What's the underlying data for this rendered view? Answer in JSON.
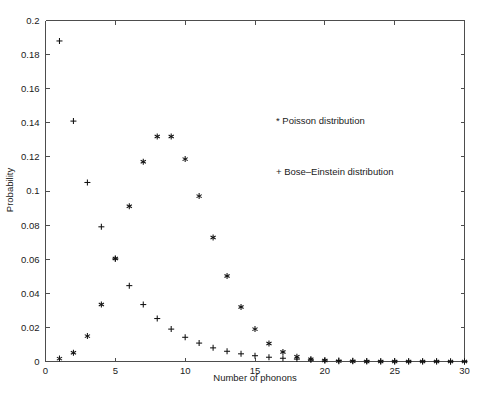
{
  "chart_data": {
    "type": "scatter",
    "title": "",
    "xlabel": "Number of phonons",
    "ylabel": "Probability",
    "xlim": [
      0,
      30
    ],
    "ylim": [
      0,
      0.2
    ],
    "xticks": [
      0,
      5,
      10,
      15,
      20,
      25,
      30
    ],
    "xticklabels": [
      "0",
      "5",
      "10",
      "15",
      "20",
      "25",
      "30"
    ],
    "yticks": [
      0,
      0.02,
      0.04,
      0.06,
      0.08,
      0.1,
      0.12,
      0.14,
      0.16,
      0.18,
      0.2
    ],
    "yticklabels": [
      "0",
      "0.02",
      "0.04",
      "0.06",
      "0.08",
      "0.1",
      "0.12",
      "0.14",
      "0.16",
      "0.18",
      "0.2"
    ],
    "grid": false,
    "legend_position": "upper-right-inside",
    "x": [
      1,
      2,
      3,
      4,
      5,
      6,
      7,
      8,
      9,
      10,
      11,
      12,
      13,
      14,
      15,
      16,
      17,
      18,
      19,
      20,
      21,
      22,
      23,
      24,
      25,
      26,
      27,
      28,
      29,
      30
    ],
    "series": [
      {
        "name": "Poisson distribution",
        "marker": "*",
        "legend_label": "* Poisson distribution",
        "color": "#111111",
        "values": [
          0.0017,
          0.0051,
          0.0149,
          0.0334,
          0.0604,
          0.0911,
          0.1172,
          0.132,
          0.132,
          0.1187,
          0.097,
          0.0727,
          0.0501,
          0.032,
          0.019,
          0.0106,
          0.0056,
          0.0028,
          0.0013,
          0.0006,
          0.0002,
          0.0001,
          0.0,
          0.0,
          0.0,
          0.0,
          0.0,
          0.0,
          0.0,
          0.0
        ]
      },
      {
        "name": "Bose-Einstein distribution",
        "marker": "+",
        "legend_label": "+ Bose–Einstein distribution",
        "color": "#111111",
        "values": [
          0.188,
          0.141,
          0.105,
          0.079,
          0.0602,
          0.0445,
          0.0334,
          0.0252,
          0.019,
          0.0142,
          0.0108,
          0.008,
          0.006,
          0.0045,
          0.0034,
          0.0025,
          0.0019,
          0.0014,
          0.001,
          0.0008,
          0.0006,
          0.0004,
          0.0003,
          0.0002,
          0.0002,
          0.0001,
          0.0001,
          0.0001,
          0.0,
          0.0
        ]
      }
    ]
  },
  "legend": {
    "poisson": "* Poisson distribution",
    "bose_einstein": "+ Bose–Einstein distribution"
  },
  "axes": {
    "xlabel": "Number of phonons",
    "ylabel": "Probability"
  }
}
